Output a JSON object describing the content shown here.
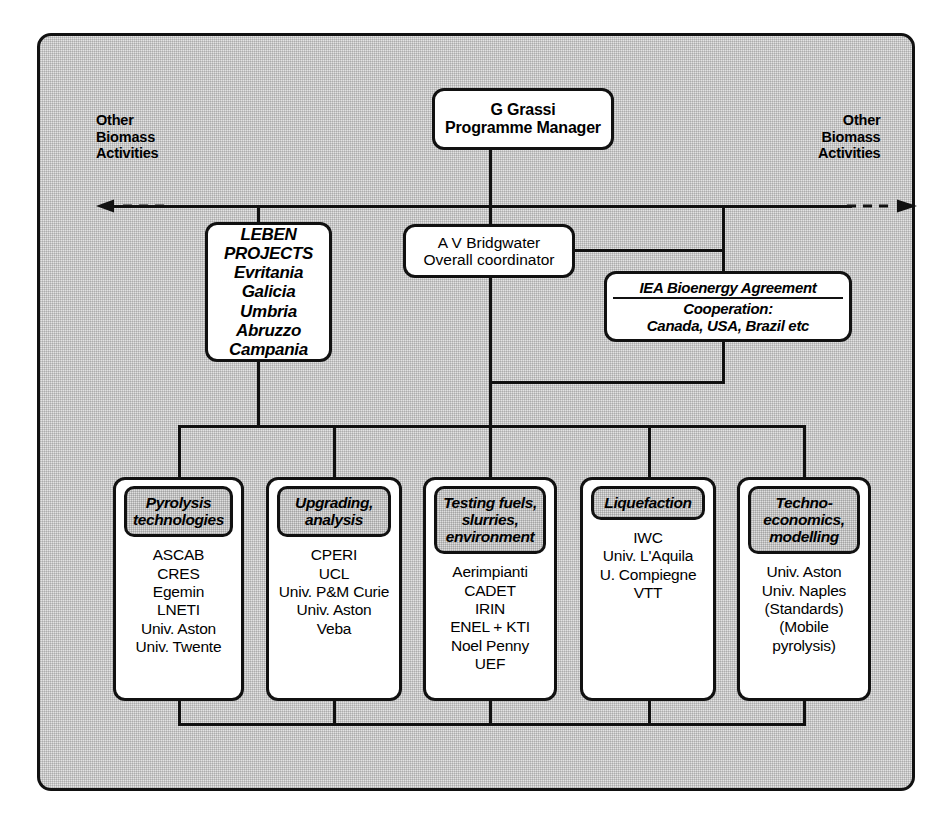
{
  "diagram": {
    "title_caption": "",
    "side_labels": {
      "left": [
        "Other",
        "Biomass",
        "Activities"
      ],
      "right": [
        "Other",
        "Biomass",
        "Activities"
      ]
    },
    "manager": {
      "lines": [
        "G Grassi",
        "Programme Manager"
      ]
    },
    "leben": {
      "lines": [
        "LEBEN",
        "PROJECTS",
        "Evritania",
        "Galicia",
        "Umbria",
        "Abruzzo",
        "Campania"
      ]
    },
    "coordinator": {
      "lines": [
        "A V Bridgwater",
        "Overall coordinator"
      ]
    },
    "iea": {
      "header": "IEA Bioenergy Agreement",
      "lines": [
        "Cooperation:",
        "Canada, USA, Brazil etc"
      ]
    },
    "columns": [
      {
        "header": [
          "Pyrolysis",
          "technologies"
        ],
        "members": [
          "ASCAB",
          "CRES",
          "Egemin",
          "LNETI",
          "Univ. Aston",
          "Univ. Twente"
        ]
      },
      {
        "header": [
          "Upgrading,",
          "analysis"
        ],
        "members": [
          "CPERI",
          "UCL",
          "Univ. P&M Curie",
          "Univ. Aston",
          "Veba"
        ]
      },
      {
        "header": [
          "Testing fuels,",
          "slurries,",
          "environment"
        ],
        "members": [
          "Aerimpianti",
          "CADET",
          "IRIN",
          "ENEL + KTI",
          "Noel Penny",
          "UEF"
        ]
      },
      {
        "header": [
          "Liquefaction"
        ],
        "members": [
          "IWC",
          "Univ. L'Aquila",
          "U. Compiegne",
          "VTT"
        ]
      },
      {
        "header": [
          "Techno-",
          "economics,",
          "modelling"
        ],
        "members": [
          "Univ. Aston",
          "Univ. Naples",
          "(Standards)",
          "(Mobile",
          "pyrolysis)"
        ]
      }
    ],
    "colors": {
      "ink": "#111111",
      "frame_fill": "#e3e3e3",
      "header_fill": "#dedede",
      "node_fill": "#ffffff"
    }
  }
}
